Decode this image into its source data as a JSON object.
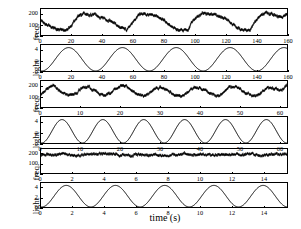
{
  "figure": {
    "xlabel": "time (s)",
    "freq_label": "freq.",
    "light_label": "light",
    "line_color": "#000000",
    "background": "#ffffff"
  },
  "panels": [
    {
      "id": "panel-1-freq-slow",
      "ylabel": "freq.",
      "yticks": [
        "0",
        "100",
        "200"
      ],
      "xticks": [
        "0",
        "20",
        "40",
        "60",
        "80",
        "100",
        "120",
        "140",
        "160"
      ]
    },
    {
      "id": "panel-2-light-slow",
      "ylabel": "light",
      "yticks": [
        "0",
        "2",
        "4"
      ],
      "xticks": [
        "0",
        "20",
        "40",
        "60",
        "80",
        "100",
        "120",
        "140",
        "160"
      ]
    },
    {
      "id": "panel-3-freq-mid",
      "ylabel": "freq.",
      "yticks": [
        "0",
        "100",
        "200"
      ],
      "xticks": [
        "0",
        "10",
        "20",
        "30",
        "40",
        "50",
        "60"
      ]
    },
    {
      "id": "panel-4-light-mid",
      "ylabel": "light",
      "yticks": [
        "0",
        "2",
        "4"
      ],
      "xticks": [
        "0",
        "10",
        "20",
        "30",
        "40",
        "50",
        "60"
      ]
    },
    {
      "id": "panel-5-freq-fast",
      "ylabel": "freq.",
      "yticks": [
        "0",
        "100",
        "200"
      ],
      "xticks": [
        "0",
        "2",
        "4",
        "6",
        "8",
        "10",
        "12",
        "14"
      ]
    },
    {
      "id": "panel-6-light-fast",
      "ylabel": "light",
      "yticks": [
        "0",
        "2",
        "4"
      ],
      "xticks": [
        "0",
        "2",
        "4",
        "6",
        "8",
        "10",
        "12",
        "14"
      ]
    }
  ],
  "chart_data": [
    {
      "type": "line",
      "title": "",
      "name": "panel-1-freq-slow",
      "xlabel": "",
      "ylabel": "freq.",
      "xlim": [
        0,
        160
      ],
      "ylim": [
        0,
        250
      ],
      "yticks": [
        0,
        100,
        200
      ],
      "xticks": [
        0,
        20,
        40,
        60,
        80,
        100,
        120,
        140,
        160
      ],
      "grid": false,
      "legend": "none",
      "series": [
        {
          "name": "firing frequency",
          "noise": 14,
          "mean": 125,
          "amplitude": 82,
          "period": 34.5,
          "phase_deg": -60,
          "x": [
            0,
            4,
            8,
            12,
            16,
            20,
            24,
            28,
            32,
            36,
            40,
            44,
            48,
            52,
            56,
            60,
            64,
            68,
            72,
            76,
            80,
            84,
            88,
            92,
            96,
            100,
            104,
            108,
            112,
            116,
            120,
            124,
            128,
            132,
            136,
            140,
            144,
            148,
            152,
            156,
            160
          ],
          "y": [
            140,
            95,
            62,
            48,
            45,
            95,
            180,
            205,
            200,
            185,
            165,
            140,
            105,
            65,
            52,
            130,
            200,
            210,
            198,
            175,
            140,
            95,
            55,
            42,
            60,
            150,
            205,
            212,
            200,
            180,
            150,
            112,
            70,
            48,
            52,
            140,
            205,
            210,
            195,
            170,
            200
          ]
        }
      ]
    },
    {
      "type": "line",
      "title": "",
      "name": "panel-2-light-slow",
      "xlabel": "",
      "ylabel": "light",
      "xlim": [
        0,
        160
      ],
      "ylim": [
        0,
        5
      ],
      "yticks": [
        0,
        2,
        4
      ],
      "xticks": [
        0,
        20,
        40,
        60,
        80,
        100,
        120,
        140,
        160
      ],
      "grid": false,
      "legend": "none",
      "series": [
        {
          "name": "light stimulus",
          "waveform": "sine",
          "mean": 2.25,
          "amplitude": 2.25,
          "period": 35,
          "phase_deg": -95,
          "cycles": 4.6
        }
      ]
    },
    {
      "type": "line",
      "title": "",
      "name": "panel-3-freq-mid",
      "xlabel": "",
      "ylabel": "freq.",
      "xlim": [
        0,
        62
      ],
      "ylim": [
        0,
        250
      ],
      "yticks": [
        0,
        100,
        200
      ],
      "xticks": [
        0,
        10,
        20,
        30,
        40,
        50,
        60
      ],
      "grid": false,
      "legend": "none",
      "series": [
        {
          "name": "firing frequency",
          "noise": 13,
          "mean": 150,
          "amplitude": 45,
          "period": 10.3,
          "phase_deg": -60,
          "x": [
            0,
            1,
            2,
            3,
            4,
            5,
            6,
            7,
            8,
            9,
            10,
            11,
            12,
            13,
            14,
            15,
            16,
            17,
            18,
            19,
            20,
            21,
            22,
            23,
            24,
            25,
            26,
            27,
            28,
            29,
            30,
            31,
            32,
            33,
            34,
            35,
            36,
            37,
            38,
            39,
            40,
            41,
            42,
            43,
            44,
            45,
            46,
            47,
            48,
            49,
            50,
            51,
            52,
            53,
            54,
            55,
            56,
            57,
            58,
            59,
            60,
            61,
            62
          ],
          "y": [
            125,
            160,
            190,
            195,
            178,
            150,
            125,
            112,
            118,
            140,
            172,
            192,
            190,
            170,
            145,
            122,
            110,
            118,
            142,
            175,
            198,
            200,
            182,
            152,
            126,
            110,
            108,
            125,
            155,
            185,
            196,
            186,
            160,
            132,
            114,
            106,
            116,
            145,
            178,
            196,
            192,
            172,
            146,
            124,
            110,
            114,
            138,
            172,
            195,
            198,
            180,
            152,
            128,
            112,
            108,
            126,
            158,
            188,
            196,
            184,
            158,
            175,
            205
          ]
        }
      ]
    },
    {
      "type": "line",
      "title": "",
      "name": "panel-4-light-mid",
      "xlabel": "",
      "ylabel": "light",
      "xlim": [
        0,
        62
      ],
      "ylim": [
        0,
        5
      ],
      "yticks": [
        0,
        2,
        4
      ],
      "xticks": [
        0,
        10,
        20,
        30,
        40,
        50,
        60
      ],
      "grid": false,
      "legend": "none",
      "series": [
        {
          "name": "light stimulus",
          "waveform": "sine",
          "mean": 2.25,
          "amplitude": 2.25,
          "period": 10.3,
          "phase_deg": -95,
          "cycles": 6.0
        }
      ]
    },
    {
      "type": "line",
      "title": "",
      "name": "panel-5-freq-fast",
      "xlabel": "",
      "ylabel": "freq.",
      "xlim": [
        0,
        15.5
      ],
      "ylim": [
        0,
        250
      ],
      "yticks": [
        0,
        100,
        200
      ],
      "xticks": [
        0,
        2,
        4,
        6,
        8,
        10,
        12,
        14
      ],
      "grid": false,
      "legend": "none",
      "series": [
        {
          "name": "firing frequency",
          "noise": 14,
          "mean": 190,
          "amplitude": 10,
          "period": 3.1,
          "phase_deg": -60,
          "x": [
            0,
            0.5,
            1,
            1.5,
            2,
            2.5,
            3,
            3.5,
            4,
            4.5,
            5,
            5.5,
            6,
            6.5,
            7,
            7.5,
            8,
            8.5,
            9,
            9.5,
            10,
            10.5,
            11,
            11.5,
            12,
            12.5,
            13,
            13.5,
            14,
            14.5,
            15,
            15.5
          ],
          "y": [
            185,
            192,
            188,
            196,
            190,
            184,
            192,
            198,
            200,
            194,
            186,
            182,
            188,
            194,
            190,
            186,
            182,
            188,
            196,
            192,
            186,
            190,
            196,
            190,
            184,
            188,
            194,
            190,
            186,
            192,
            196,
            200
          ]
        }
      ]
    },
    {
      "type": "line",
      "title": "",
      "name": "panel-6-light-fast",
      "xlabel": "time (s)",
      "ylabel": "light",
      "xlim": [
        0,
        15.5
      ],
      "ylim": [
        0,
        5
      ],
      "yticks": [
        0,
        2,
        4
      ],
      "xticks": [
        0,
        2,
        4,
        6,
        8,
        10,
        12,
        14
      ],
      "grid": false,
      "legend": "none",
      "series": [
        {
          "name": "light stimulus",
          "waveform": "sine",
          "mean": 2.25,
          "amplitude": 2.25,
          "period": 3.1,
          "phase_deg": -95,
          "cycles": 5.0
        }
      ]
    }
  ]
}
